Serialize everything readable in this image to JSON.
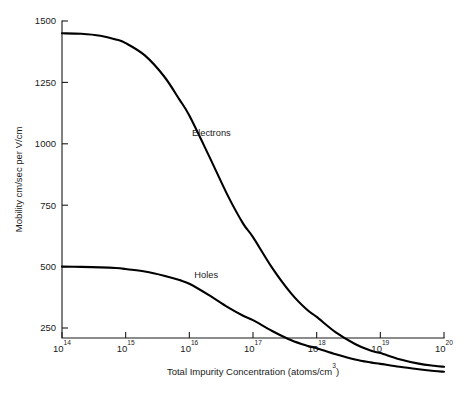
{
  "chart_data": {
    "type": "line",
    "title": "",
    "xlabel": "Total Impurity Concentration (atoms/cm³)",
    "ylabel": "Mobility cm/sec per V/cm",
    "xscale": "log",
    "yscale": "linear",
    "xlim": [
      100000000000000.0,
      1e+20
    ],
    "ylim": [
      88,
      1530
    ],
    "grid": false,
    "legend_position": "inline-annotations",
    "x_tick_labels": [
      "10¹⁴",
      "10¹⁵",
      "10¹⁶",
      "10¹⁷",
      "10¹⁸",
      "10¹⁹",
      "10²⁰"
    ],
    "x_tick_mantissa": [
      "10",
      "10",
      "10",
      "10",
      "10",
      "10",
      "10"
    ],
    "x_tick_exponents": [
      "14",
      "15",
      "16",
      "17",
      "18",
      "19",
      "20"
    ],
    "x_tick_values": [
      100000000000000.0,
      1000000000000000.0,
      1e+16,
      1e+17,
      1e+18,
      1e+19,
      1e+20
    ],
    "y_tick_labels": [
      "250",
      "500",
      "750",
      "1000",
      "1250",
      "1500"
    ],
    "y_tick_values": [
      250,
      500,
      750,
      1000,
      1250,
      1500
    ],
    "series": [
      {
        "name": "Electrons",
        "label": "Electrons",
        "label_x": 1.1e+16,
        "label_y": 1030,
        "color": "#000000",
        "x": [
          100000000000000.0,
          200000000000000.0,
          400000000000000.0,
          700000000000000.0,
          1000000000000000.0,
          2000000000000000.0,
          4000000000000000.0,
          7000000000000000.0,
          1e+16,
          2e+16,
          4e+16,
          7e+16,
          1e+17,
          2e+17,
          4e+17,
          7e+17,
          1e+18,
          2e+18,
          4e+18,
          7e+18,
          1e+19,
          2e+19,
          4e+19,
          7e+19,
          1e+20
        ],
        "values": [
          1450,
          1448,
          1440,
          1425,
          1410,
          1360,
          1275,
          1180,
          1115,
          955,
          790,
          675,
          620,
          495,
          390,
          325,
          295,
          232,
          185,
          158,
          148,
          123,
          105,
          96,
          92
        ]
      },
      {
        "name": "Holes",
        "label": "Holes",
        "label_x": 1.2e+16,
        "label_y": 452,
        "color": "#000000",
        "x": [
          100000000000000.0,
          200000000000000.0,
          400000000000000.0,
          700000000000000.0,
          1000000000000000.0,
          2000000000000000.0,
          4000000000000000.0,
          7000000000000000.0,
          1e+16,
          2e+16,
          4e+16,
          7e+16,
          1e+17,
          2e+17,
          4e+17,
          7e+17,
          1e+18,
          2e+18,
          4e+18,
          7e+18,
          1e+19,
          2e+19,
          4e+19,
          7e+19,
          1e+20
        ],
        "values": [
          500,
          499,
          497,
          494,
          490,
          480,
          463,
          445,
          430,
          385,
          335,
          300,
          282,
          238,
          200,
          178,
          168,
          143,
          122,
          110,
          104,
          92,
          82,
          75,
          72
        ]
      }
    ]
  },
  "axes": {
    "y_axis_title": "Mobility cm/sec per V/cm",
    "x_axis_title_main": "Total Impurity Concentration (atoms/cm",
    "x_axis_title_sup": "3",
    "x_axis_title_tail": ")"
  },
  "colors": {
    "curve": "#000000",
    "axis": "#1a1a1a",
    "background": "#ffffff"
  }
}
